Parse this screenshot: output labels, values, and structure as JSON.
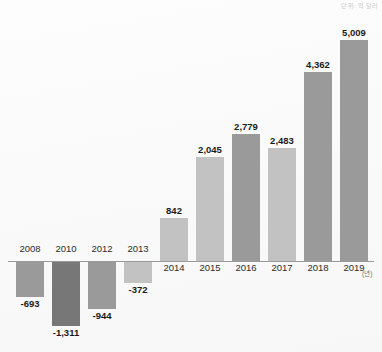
{
  "caption": {
    "unit_note": "단위: 억 달러"
  },
  "axis": {
    "unit_suffix": "(년)",
    "zero_line": true
  },
  "colors": {
    "background": "#fbfbfb",
    "bar_light": "#c2c2c2",
    "bar_medium": "#9a9a9a",
    "bar_dark": "#777777",
    "axis_line": "#9a9a9a",
    "label_text": "#1b1b1b",
    "year_text": "#2b2b2b"
  },
  "chart_data": {
    "type": "bar",
    "title": "",
    "subtitle": "",
    "xlabel": "(년)",
    "ylabel": "",
    "unit": "단위: 억 달러",
    "grid": false,
    "legend": "none",
    "ylim": [
      -1311,
      5009
    ],
    "categories": [
      "2008",
      "2010",
      "2012",
      "2013",
      "2014",
      "2015",
      "2016",
      "2017",
      "2018",
      "2019"
    ],
    "values": [
      -693,
      -1311,
      -944,
      -372,
      842,
      2045,
      2779,
      2483,
      4362,
      5009
    ],
    "value_labels": [
      "-693",
      "-1,311",
      "-944",
      "-372",
      "842",
      "2,045",
      "2,779",
      "2,483",
      "4,362",
      "5,009"
    ],
    "bars": [
      {
        "year": "2008",
        "value": -693,
        "label": "-693",
        "color": "#9a9a9a",
        "x": 16,
        "w": 28,
        "px_top": 262,
        "px_h": 35,
        "label_y": 298,
        "year_y": 243
      },
      {
        "year": "2010",
        "value": -1311,
        "label": "-1,311",
        "color": "#777777",
        "x": 52,
        "w": 28,
        "px_top": 262,
        "px_h": 64,
        "label_y": 327,
        "year_y": 243
      },
      {
        "year": "2012",
        "value": -944,
        "label": "-944",
        "color": "#9a9a9a",
        "x": 88,
        "w": 28,
        "px_top": 262,
        "px_h": 47,
        "label_y": 310,
        "year_y": 243
      },
      {
        "year": "2013",
        "value": -372,
        "label": "-372",
        "color": "#c2c2c2",
        "x": 124,
        "w": 28,
        "px_top": 262,
        "px_h": 21,
        "label_y": 284,
        "year_y": 243
      },
      {
        "year": "2014",
        "value": 842,
        "label": "842",
        "color": "#c2c2c2",
        "x": 160,
        "w": 28,
        "px_h": 43,
        "label_y": 205,
        "year_y": 262
      },
      {
        "year": "2015",
        "value": 2045,
        "label": "2,045",
        "color": "#c2c2c2",
        "x": 196,
        "w": 28,
        "px_h": 104,
        "label_y": 144,
        "year_y": 262
      },
      {
        "year": "2016",
        "value": 2779,
        "label": "2,779",
        "color": "#9a9a9a",
        "x": 232,
        "w": 28,
        "px_h": 127,
        "label_y": 121,
        "year_y": 262
      },
      {
        "year": "2017",
        "value": 2483,
        "label": "2,483",
        "color": "#c2c2c2",
        "x": 268,
        "w": 28,
        "px_h": 113,
        "label_y": 135,
        "year_y": 262
      },
      {
        "year": "2018",
        "value": 4362,
        "label": "4,362",
        "color": "#9a9a9a",
        "x": 304,
        "w": 28,
        "px_h": 189,
        "label_y": 59,
        "year_y": 262
      },
      {
        "year": "2019",
        "value": 5009,
        "label": "5,009",
        "color": "#9a9a9a",
        "x": 340,
        "w": 28,
        "px_h": 221,
        "label_y": 27,
        "year_y": 262
      }
    ]
  }
}
